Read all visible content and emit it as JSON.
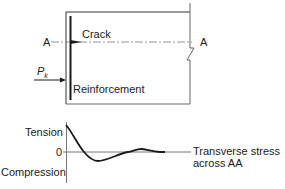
{
  "diagram": {
    "section_label_left": "A",
    "section_label_right": "A",
    "crack_label": "Crack",
    "load_label": "P",
    "load_subscript": "k",
    "reinforcement_label": "Reinforcement"
  },
  "graph": {
    "tension_label": "Tension",
    "zero_label": "0",
    "compression_label": "Compression",
    "curve_label_line1": "Transverse stress",
    "curve_label_line2": "across AA",
    "stress_profile": {
      "description": "damped oscillation: tension at reinforcement, dips to compression, slight tension, decays to zero",
      "points_relative": [
        [
          0,
          1.0
        ],
        [
          0.15,
          0
        ],
        [
          0.25,
          -0.35
        ],
        [
          0.5,
          0
        ],
        [
          0.6,
          0.12
        ],
        [
          0.8,
          0
        ],
        [
          1.0,
          0
        ]
      ]
    }
  },
  "colors": {
    "line": "#1a1a1a",
    "thin_line": "#555555"
  }
}
